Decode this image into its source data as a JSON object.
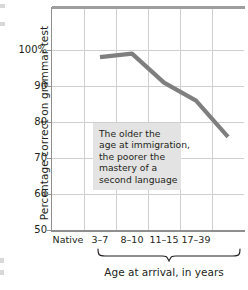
{
  "chart_data": {
    "type": "line",
    "title": "",
    "xlabel": "Age at arrival, in years",
    "ylabel": "Percentage correct on grammar test",
    "categories": [
      "Native",
      "3–7",
      "8–10",
      "11–15",
      "17–39"
    ],
    "values": [
      98,
      99,
      91,
      86,
      76
    ],
    "ylim": [
      50,
      100
    ],
    "yticks": [
      "100%",
      "90",
      "80",
      "70",
      "60",
      "50"
    ],
    "ytick_values": [
      100,
      90,
      80,
      70,
      60,
      50
    ],
    "grid": true,
    "legend": "none",
    "series": [
      {
        "name": "Grammar test score",
        "values": [
          98,
          99,
          91,
          86,
          76
        ],
        "color": "#7f7f7f"
      }
    ],
    "annotations": [
      {
        "name": "callout",
        "lines": [
          "The older the",
          "age at immigration,",
          "the poorer the",
          "mastery of a",
          "second language"
        ],
        "background": "#e3e3e3"
      }
    ],
    "brace": {
      "label": "Age at arrival, in years",
      "spans": [
        "3–7",
        "8–10",
        "11–15",
        "17–39"
      ]
    }
  },
  "axes": {
    "y_title": "Percentage correct on grammar test",
    "x_title": "Age at arrival, in years",
    "y_ticks": [
      {
        "label": "100%",
        "value": 100
      },
      {
        "label": "90",
        "value": 90
      },
      {
        "label": "80",
        "value": 80
      },
      {
        "label": "70",
        "value": 70
      },
      {
        "label": "60",
        "value": 60
      },
      {
        "label": "50",
        "value": 50
      }
    ],
    "x_ticks": [
      {
        "label": "Native"
      },
      {
        "label": "3–7"
      },
      {
        "label": "8–10"
      },
      {
        "label": "11–15"
      },
      {
        "label": "17–39"
      }
    ]
  },
  "annotation": {
    "line1": "The older the",
    "line2": "age at immigration,",
    "line3": "the poorer the",
    "line4": "mastery of a",
    "line5": "second language"
  },
  "colors": {
    "line": "#7f7f7f",
    "grid": "#cfcfcf",
    "axis": "#8f8f8f",
    "annotation_bg": "#e3e3e3",
    "text": "#231f20"
  }
}
